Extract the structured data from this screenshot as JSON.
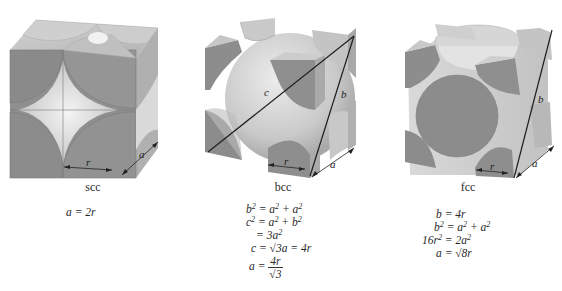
{
  "figure": {
    "panels": [
      {
        "id": "scc",
        "caption": "scc",
        "labels": {
          "r": "r",
          "a": "a"
        },
        "equations": [
          "a = 2r"
        ]
      },
      {
        "id": "bcc",
        "caption": "bcc",
        "labels": {
          "r": "r",
          "a": "a",
          "b": "b",
          "c": "c"
        },
        "equations": {
          "l1_lhs": "b",
          "l1_rhs": "= a",
          "l1_rhs2": " + a",
          "l2_lhs": "c",
          "l2_rhs": "= a",
          "l2_rhs2": " + b",
          "l3": "= 3a",
          "l4": "c = √3a = 4r",
          "l5_lhs": "a =",
          "l5_num": "4r",
          "l5_den": "√3",
          "sup": "2"
        }
      },
      {
        "id": "fcc",
        "caption": "fcc",
        "labels": {
          "r": "r",
          "a": "a",
          "b": "b"
        },
        "equations": {
          "l1": "b = 4r",
          "l2_lhs": "b",
          "l2_rhs": "= a",
          "l2_rhs2": " + a",
          "l3_lhs": "16r",
          "l3_rhs": "= 2a",
          "l4": "a = √8r",
          "sup": "2"
        }
      }
    ],
    "colors": {
      "face_dark": "#8c8c8c",
      "face_mid": "#a9a9a9",
      "face_light": "#c8c8c8",
      "sphere_light": "#e6e6e6",
      "line": "#1e1e1e",
      "background": "#ffffff"
    }
  }
}
